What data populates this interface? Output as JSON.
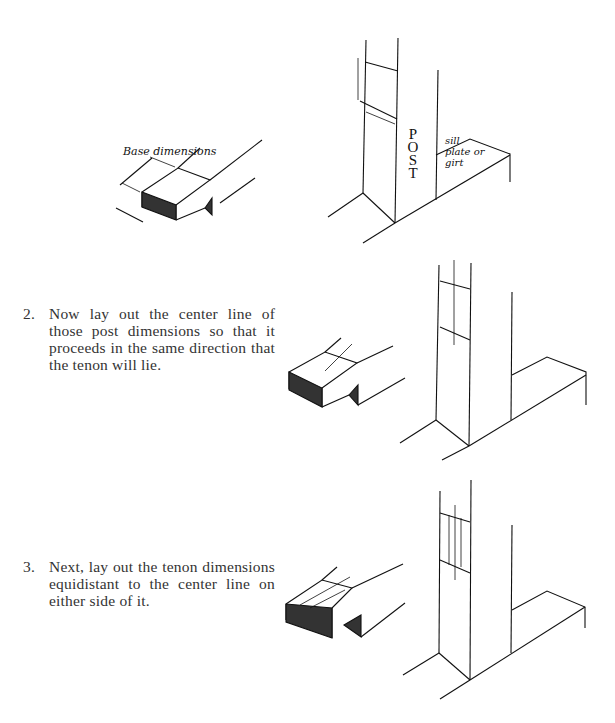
{
  "figure1": {
    "base_label": "Base dimensions",
    "post_label": [
      "P",
      "O",
      "S",
      "T"
    ],
    "sill_label_line1": "sill",
    "sill_label_line2": "plate or",
    "sill_label_line3": "girt"
  },
  "steps": [
    {
      "number": "2.",
      "text": "Now lay out the center line of those post dimensions so that it proceeds in the same direction that the tenon will lie."
    },
    {
      "number": "3.",
      "text": "Next, lay out the tenon dimensions equidistant to the center line on either side of it."
    }
  ]
}
